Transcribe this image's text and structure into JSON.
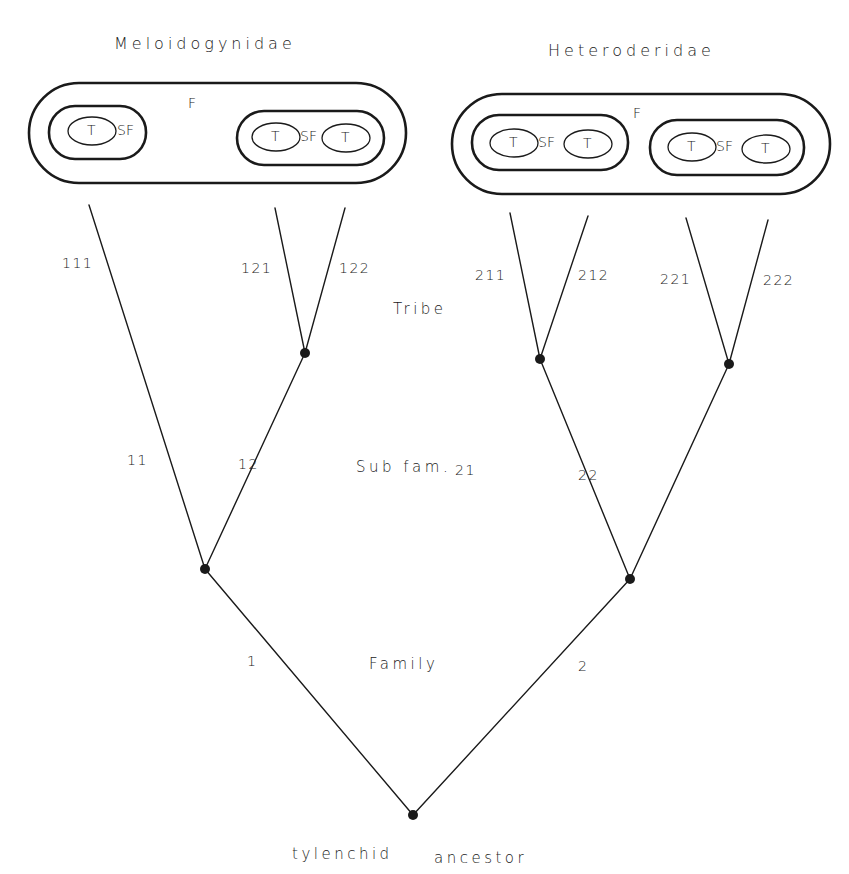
{
  "families": [
    {
      "name": "Meloidogynidae",
      "family_label": "F",
      "subfamilies": [
        {
          "label": "SF",
          "tribes": [
            "T"
          ]
        },
        {
          "label": "SF",
          "tribes": [
            "T",
            "T"
          ]
        }
      ]
    },
    {
      "name": "Heteroderidae",
      "family_label": "F",
      "subfamilies": [
        {
          "label": "SF",
          "tribes": [
            "T",
            "T"
          ]
        },
        {
          "label": "SF",
          "tribes": [
            "T",
            "T"
          ]
        }
      ]
    }
  ],
  "ranks": {
    "tribe": "Tribe",
    "subfamily": "Sub fam.",
    "family": "Family"
  },
  "root_label_1": "tylenchid",
  "root_label_2": "ancestor",
  "branches": {
    "b1": "1",
    "b2": "2",
    "b11": "11",
    "b12": "12",
    "b21": "21",
    "b22": "22",
    "b111": "111",
    "b121": "121",
    "b122": "122",
    "b211": "211",
    "b212": "212",
    "b221": "221",
    "b222": "222"
  },
  "colors": {
    "ink": "#1a1a1a",
    "background": "#ffffff"
  }
}
